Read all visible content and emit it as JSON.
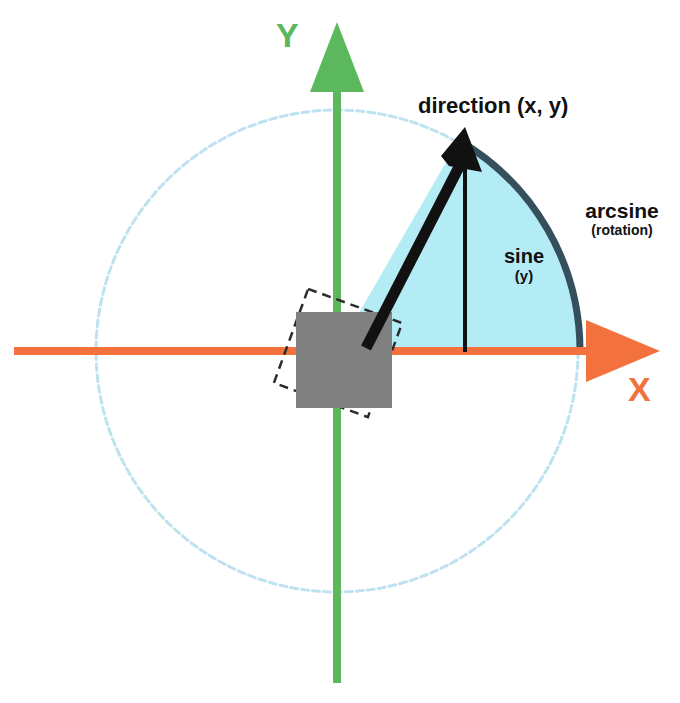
{
  "diagram": {
    "labels": {
      "y_axis": "Y",
      "x_axis": "X",
      "direction": "direction (x, y)",
      "arcsine_main": "arcsine",
      "arcsine_sub": "(rotation)",
      "sine_main": "sine",
      "sine_sub": "(y)"
    },
    "colors": {
      "y_axis": "#5cb85c",
      "x_axis": "#f2713c",
      "circle": "#b8dff0",
      "sector_fill": "#b3ecf5",
      "arc_stroke": "#35505c",
      "vector": "#111111",
      "sprite_fill": "#808080",
      "sprite_outline": "#2b2b2b",
      "background": "#ffffff"
    },
    "geometry": {
      "origin_x": 337,
      "origin_y": 351,
      "radius": 241,
      "angle_degrees": 60,
      "sprite_size": 96,
      "sprite_rotation_degrees": 20,
      "vector_tip_x": 465,
      "vector_tip_y": 136
    },
    "elements": [
      "unit-circle",
      "x-axis-arrow",
      "y-axis-arrow",
      "angle-sector",
      "arc-stroke",
      "direction-vector",
      "sine-drop-line",
      "sprite-square",
      "sprite-rotated-outline"
    ]
  }
}
